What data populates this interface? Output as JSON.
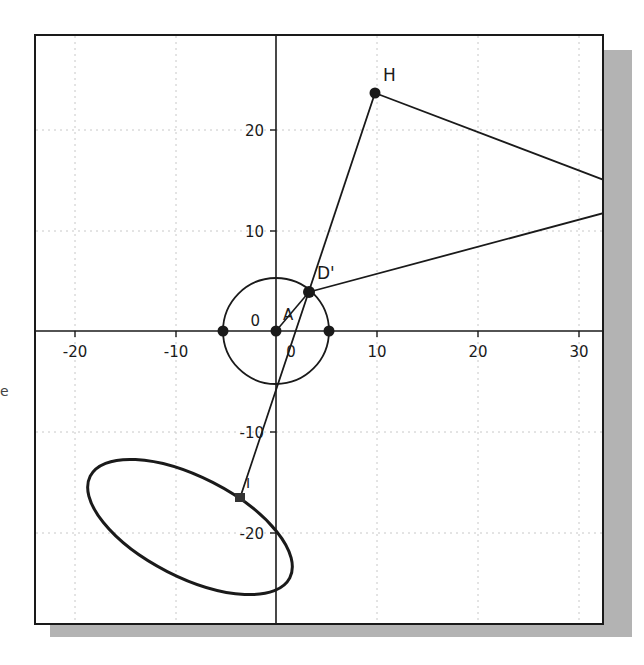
{
  "edge_fragment": "e",
  "plot": {
    "x_ticks": [
      {
        "value": -20,
        "label": "-20"
      },
      {
        "value": -10,
        "label": "-10"
      },
      {
        "value": 0,
        "label": "0"
      },
      {
        "value": 10,
        "label": "10"
      },
      {
        "value": 20,
        "label": "20"
      },
      {
        "value": 30,
        "label": "30"
      }
    ],
    "y_ticks": [
      {
        "value": 20,
        "label": "20"
      },
      {
        "value": 10,
        "label": "10"
      },
      {
        "value": 0,
        "label": "0"
      },
      {
        "value": -10,
        "label": "-10"
      },
      {
        "value": -20,
        "label": "-20"
      }
    ],
    "points": {
      "H": {
        "label": "H",
        "x": 9.8,
        "y": 23.6
      },
      "D_prime": {
        "label": "D'",
        "x": 3.3,
        "y": 3.8
      },
      "A": {
        "label": "A",
        "x": 0,
        "y": 0
      },
      "I": {
        "label": "I",
        "x": -3.6,
        "y": -16.5
      }
    },
    "circle": {
      "cx": 0,
      "cy": 0,
      "r": 5.3
    },
    "ellipse": {
      "cx": -8.5,
      "cy": -19.5,
      "rx": 11.2,
      "ry": 5.0,
      "rotation_deg": 27
    },
    "colors": {
      "line": "#1a1a1a",
      "grid": "#c8c8c8",
      "shadow": "#b3b3b3"
    }
  }
}
